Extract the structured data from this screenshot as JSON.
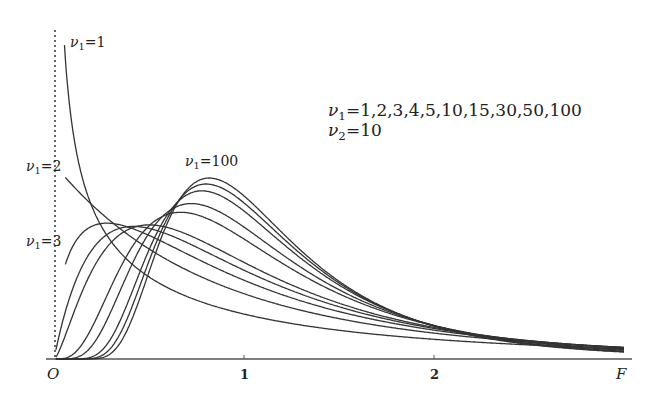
{
  "chart_data": {
    "type": "line",
    "title": "",
    "xlabel": "F",
    "ylabel": "",
    "origin_label": "O",
    "xlim": [
      0,
      3.1
    ],
    "ylim": [
      0,
      1.7
    ],
    "x_ticks": [
      1,
      2
    ],
    "x_tick_labels": [
      "1",
      "2"
    ],
    "grid": false,
    "nu2": 10,
    "nu1_values": [
      1,
      2,
      3,
      4,
      5,
      10,
      15,
      30,
      50,
      100
    ],
    "x_range": [
      0.0,
      3.0
    ],
    "series": [
      {
        "name": "ν1=1",
        "nu1": 1,
        "nu2": 10,
        "peak_x": 0.0,
        "behavior": "decreasing from +∞"
      },
      {
        "name": "ν1=2",
        "nu1": 2,
        "nu2": 10,
        "peak_x": 0.0,
        "peak_y": 1.0
      },
      {
        "name": "ν1=3",
        "nu1": 3,
        "nu2": 10,
        "peak_x": 0.278,
        "peak_y": 0.72
      },
      {
        "name": "ν1=4",
        "nu1": 4,
        "nu2": 10,
        "peak_x": 0.417,
        "peak_y": 0.72
      },
      {
        "name": "ν1=5",
        "nu1": 5,
        "nu2": 10,
        "peak_x": 0.5,
        "peak_y": 0.73
      },
      {
        "name": "ν1=10",
        "nu1": 10,
        "nu2": 10,
        "peak_x": 0.667,
        "peak_y": 0.77
      },
      {
        "name": "ν1=15",
        "nu1": 15,
        "nu2": 10,
        "peak_x": 0.722,
        "peak_y": 0.81
      },
      {
        "name": "ν1=30",
        "nu1": 30,
        "nu2": 10,
        "peak_x": 0.778,
        "peak_y": 0.87
      },
      {
        "name": "ν1=50",
        "nu1": 50,
        "nu2": 10,
        "peak_x": 0.8,
        "peak_y": 0.9
      },
      {
        "name": "ν1=100",
        "nu1": 100,
        "nu2": 10,
        "peak_x": 0.817,
        "peak_y": 0.92
      }
    ],
    "annotations": {
      "curve_labels": [
        "ν1=1",
        "ν1=2",
        "ν1=3",
        "ν1=100"
      ],
      "legend_line1": "ν1=1,2,3,4,5,10,15,30,50,100",
      "legend_line2": "ν2=10"
    },
    "colors": {
      "curve": "#333333",
      "axis": "#444444",
      "background": "#ffffff"
    }
  },
  "labels": {
    "nu": "ν",
    "nu1_1": {
      "sub": "1",
      "rest": "=1"
    },
    "nu1_2": {
      "sub": "1",
      "rest": "=2"
    },
    "nu1_3": {
      "sub": "1",
      "rest": "=3"
    },
    "nu1_100": {
      "sub": "1",
      "rest": "=100"
    },
    "legend1": {
      "sub": "1",
      "rest": "=1,2,3,4,5,10,15,30,50,100"
    },
    "legend2": {
      "sub": "2",
      "rest": "=10"
    },
    "origin": "O",
    "tick1": "1",
    "tick2": "2",
    "x_axis": "F"
  }
}
